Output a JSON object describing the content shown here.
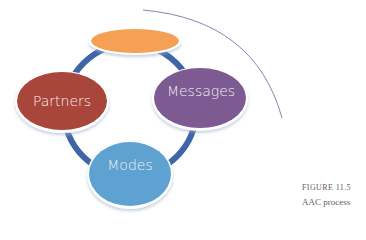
{
  "diagram": {
    "type": "cycle",
    "nodes": [
      {
        "id": "top",
        "label": "",
        "color": "#f5a155"
      },
      {
        "id": "partners",
        "label": "Partners",
        "color": "#a9463b"
      },
      {
        "id": "messages",
        "label": "Messages",
        "color": "#7d5a92"
      },
      {
        "id": "modes",
        "label": "Modes",
        "color": "#5ea2d1"
      }
    ],
    "ring_color": "#3f64a8",
    "arc_color": "#5b6c9c"
  },
  "caption": {
    "figure": "FIGURE 11.5",
    "title": "AAC process"
  }
}
